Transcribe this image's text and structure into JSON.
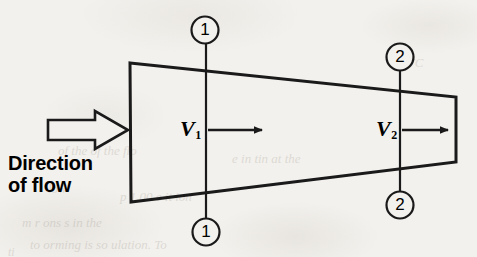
{
  "figure": {
    "background_color": "#f3f1ed",
    "ink_color": "#1a1a1a"
  },
  "flow_indicator": {
    "arrow_icon": "block-arrow-right-icon",
    "caption_line_1": "Direction",
    "caption_line_2": "of flow"
  },
  "velocities": [
    {
      "id": "v1",
      "symbol": "V",
      "subscript": "1",
      "arrow_icon": "arrow-right-icon",
      "x": 190,
      "y": 130
    },
    {
      "id": "v2",
      "symbol": "V",
      "subscript": "2",
      "arrow_icon": "arrow-right-icon",
      "x": 385,
      "y": 130
    }
  ],
  "section_markers": [
    {
      "id": "section-1-top",
      "label": "1",
      "cx": 205,
      "cy": 30,
      "r": 14
    },
    {
      "id": "section-1-bottom",
      "label": "1",
      "cx": 206,
      "cy": 232,
      "r": 14
    },
    {
      "id": "section-2-top",
      "label": "2",
      "cx": 400,
      "cy": 57,
      "r": 14
    },
    {
      "id": "section-2-bottom",
      "label": "2",
      "cx": 400,
      "cy": 205,
      "r": 14
    }
  ],
  "section_lines": [
    {
      "id": "section-line-1",
      "x": 206,
      "y_top": 42,
      "y_bottom": 220
    },
    {
      "id": "section-line-2",
      "x": 400,
      "y_top": 70,
      "y_bottom": 193
    }
  ],
  "duct": {
    "shape": "converging-tapered-duct",
    "top_left": {
      "x": 130,
      "y": 63
    },
    "top_right": {
      "x": 456,
      "y": 97
    },
    "bottom_right": {
      "x": 456,
      "y": 162
    },
    "bottom_left": {
      "x": 131,
      "y": 202
    }
  },
  "ghost_text": [
    {
      "text": "WC",
      "x": 404,
      "y": 62,
      "size": 13
    },
    {
      "text": "of  the  of  the  flo",
      "x": 58,
      "y": 150,
      "size": 13
    },
    {
      "text": "e in  tin  at  the",
      "x": 232,
      "y": 158,
      "size": 13
    },
    {
      "text": "low",
      "x": 48,
      "y": 188,
      "size": 13
    },
    {
      "text": "p 1.00    e    it  ion",
      "x": 120,
      "y": 196,
      "size": 13
    },
    {
      "text": "m  r  ons  s  in  the",
      "x": 22,
      "y": 222,
      "size": 13
    },
    {
      "text": "to   orming  is   so ulation.  To",
      "x": 30,
      "y": 244,
      "size": 13
    },
    {
      "text": "ti",
      "x": 8,
      "y": 252,
      "size": 12
    }
  ]
}
